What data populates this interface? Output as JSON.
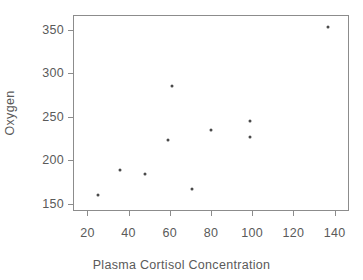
{
  "chart_data": {
    "type": "scatter",
    "title": "",
    "xlabel": "Plasma Cortisol Concentration",
    "ylabel": "Oxygen",
    "xlim": [
      13,
      147
    ],
    "ylim": [
      142,
      367
    ],
    "xticks": [
      20,
      40,
      60,
      80,
      100,
      120,
      140
    ],
    "yticks": [
      150,
      200,
      250,
      300,
      350
    ],
    "xticklabels": [
      "20",
      "40",
      "60",
      "80",
      "100",
      "120",
      "140"
    ],
    "yticklabels": [
      "150",
      "200",
      "250",
      "300",
      "350"
    ],
    "grid": false,
    "legend": null,
    "marker": "dot",
    "marker_color": "#4a4a4a",
    "points": [
      {
        "x": 25,
        "y": 160
      },
      {
        "x": 36,
        "y": 189
      },
      {
        "x": 48,
        "y": 184
      },
      {
        "x": 59,
        "y": 224
      },
      {
        "x": 61,
        "y": 285
      },
      {
        "x": 71,
        "y": 167
      },
      {
        "x": 80,
        "y": 235
      },
      {
        "x": 99,
        "y": 245
      },
      {
        "x": 99,
        "y": 227
      },
      {
        "x": 137,
        "y": 353
      }
    ]
  },
  "axes": {
    "frame_color": "#8c8c8c"
  }
}
